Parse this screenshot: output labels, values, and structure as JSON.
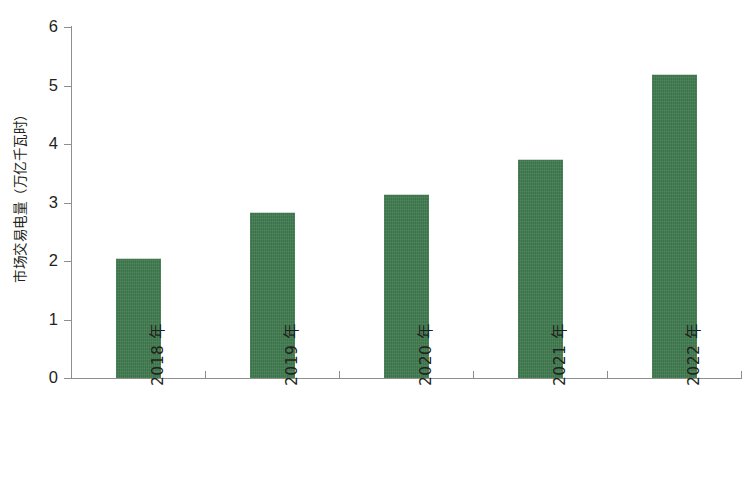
{
  "chart_data": {
    "type": "bar",
    "title": "",
    "subtitle": "",
    "xlabel": "",
    "ylabel": "市场交易电量（万亿千瓦时）",
    "categories": [
      "2018 年",
      "2019 年",
      "2020 年",
      "2021 年",
      "2022 年"
    ],
    "values": [
      2.05,
      2.83,
      3.14,
      3.75,
      5.2
    ],
    "series": [
      {
        "name": "市场交易电量",
        "values": [
          2.05,
          2.83,
          3.14,
          3.75,
          5.2
        ]
      }
    ],
    "ylim": [
      0,
      6
    ],
    "xlim": [
      0,
      5
    ],
    "ytick_labels": [
      "0",
      "1",
      "2",
      "3",
      "4",
      "5",
      "6"
    ],
    "ytick_values": [
      0,
      1,
      2,
      3,
      4,
      5,
      6
    ],
    "grid": false,
    "legend": false,
    "legend_position": "none",
    "bar_color": "#3f7a4e",
    "axis_color": "#8e8e8e",
    "text_color": "#231f20",
    "background_color": "#ffffff",
    "xtick_label_rotation": 90,
    "ylabel_rotation": 90,
    "annotations": []
  }
}
